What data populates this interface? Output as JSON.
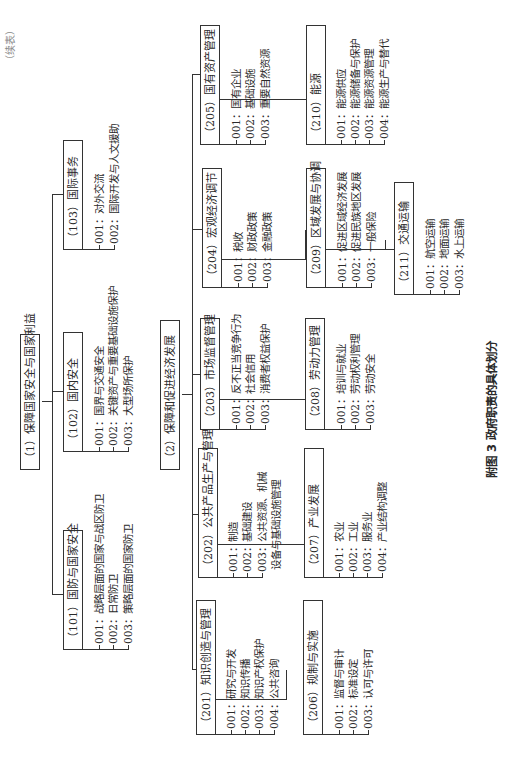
{
  "figure": {
    "caption": "附图 3   政府职责的具体划分",
    "corner_note": "（续表）"
  },
  "nodes": {
    "n1": {
      "label": "（1）保障国家安全与国家利益"
    },
    "n2": {
      "label": "（2）保障和促进经济发展"
    },
    "n101": {
      "label": "（101）国防与国家安全",
      "items": [
        "001：战略层面的国家与战区防卫",
        "002：日常防卫",
        "003：策略层面的国家防卫"
      ]
    },
    "n102": {
      "label": "（102）国内安全",
      "items": [
        "001：国界与交通安全",
        "002：关键资产与重要基础设施保护",
        "003：大型场所保护"
      ]
    },
    "n103": {
      "label": "（103）国际事务",
      "items": [
        "001：对外交流",
        "002：国际开发与人文援助"
      ]
    },
    "n201": {
      "label": "（201）知识创造与管理",
      "items": [
        "001：研究与开发",
        "002：知识传播",
        "003：知识产权保护",
        "004：公共咨询"
      ]
    },
    "n202": {
      "label": "（202）公共产品生产与管理",
      "items": [
        "001：制造",
        "002：基础建设",
        "003：公共资源、机械",
        "设备与基础设施管理"
      ]
    },
    "n203": {
      "label": "（203）市场监督管理",
      "items": [
        "001：反不正当竞争行为",
        "002：社会信用",
        "003：消费者权益保护"
      ]
    },
    "n204": {
      "label": "（204）宏观经济调节",
      "items": [
        "001：税收",
        "002：财政政策",
        "003：金融政策"
      ]
    },
    "n205": {
      "label": "（205）国有资产管理",
      "items": [
        "001：国有企业",
        "002：基础设施",
        "003：重要自然资源"
      ]
    },
    "n206": {
      "label": "（206）规制与实施",
      "items": [
        "001：监督与审计",
        "002：标准设定",
        "003：认可与许可"
      ]
    },
    "n207": {
      "label": "（207）产业发展",
      "items": [
        "001：农业",
        "002：工业",
        "003：服务业",
        "004：产业结构调整"
      ]
    },
    "n208": {
      "label": "（208）劳动力管理",
      "items": [
        "001：培训与就业",
        "002：劳动权利管理",
        "003：劳动安全"
      ]
    },
    "n209": {
      "label": "（209）区域发展与协调",
      "items": [
        "001：促进区域经济发展",
        "002：促进民族地区发展",
        "003：一般保险"
      ]
    },
    "n210": {
      "label": "（210）能源",
      "items": [
        "001：能源供应",
        "002：能源储备与保护",
        "003：能源资源管理",
        "004：能源生产与替代"
      ]
    },
    "n211": {
      "label": "（211）交通运输",
      "items": [
        "001：航空运输",
        "002：地面运输",
        "003：水上运输"
      ]
    }
  }
}
